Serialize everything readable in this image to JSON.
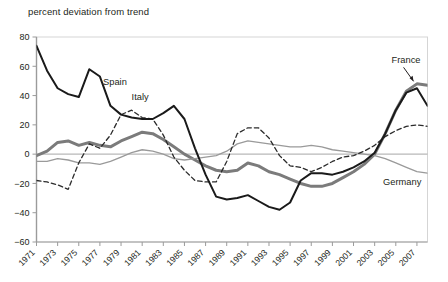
{
  "axis_title": "percent deviation from trend",
  "chart_data": {
    "type": "line",
    "title": "",
    "subtitle": "",
    "xlabel": "",
    "ylabel": "percent deviation from trend",
    "ylim": [
      -60,
      80
    ],
    "xlim": [
      1971,
      2008
    ],
    "grid": false,
    "legend_position": "inline-annotations",
    "yticks": [
      80,
      60,
      40,
      20,
      0,
      -20,
      -40,
      -60
    ],
    "ytick_labels": [
      "80",
      "60",
      "40",
      "20",
      "0",
      "−20",
      "−40",
      "−60"
    ],
    "xticks": [
      1971,
      1973,
      1975,
      1977,
      1979,
      1981,
      1983,
      1985,
      1987,
      1989,
      1991,
      1993,
      1995,
      1997,
      1999,
      2001,
      2003,
      2005,
      2007
    ],
    "xtick_labels": [
      "1971",
      "1973",
      "1975",
      "1977",
      "1979",
      "1981",
      "1983",
      "1985",
      "1987",
      "1989",
      "1991",
      "1993",
      "1995",
      "1997",
      "1999",
      "2001",
      "2003",
      "2005",
      "2007"
    ],
    "zero_line": 0,
    "x": [
      1971,
      1972,
      1973,
      1974,
      1975,
      1976,
      1977,
      1978,
      1979,
      1980,
      1981,
      1982,
      1983,
      1984,
      1985,
      1986,
      1987,
      1988,
      1989,
      1990,
      1991,
      1992,
      1993,
      1994,
      1995,
      1996,
      1997,
      1998,
      1999,
      2000,
      2001,
      2002,
      2003,
      2004,
      2005,
      2006,
      2007,
      2008
    ],
    "series": [
      {
        "name": "Spain",
        "style": "solid-black",
        "color": "#1a1a1a",
        "width": 2.0,
        "values": [
          74,
          57,
          45,
          41,
          39,
          58,
          53,
          33,
          27,
          25,
          24,
          24,
          28,
          33,
          24,
          4,
          -14,
          -29,
          -31,
          -30,
          -28,
          -32,
          -36,
          -38,
          -33,
          -18,
          -13,
          -13,
          -14,
          -12,
          -9,
          -5,
          1,
          14,
          30,
          42,
          45,
          33
        ]
      },
      {
        "name": "Italy",
        "style": "dashed-black",
        "color": "#2b2b2b",
        "width": 1.3,
        "values": [
          -18,
          -19,
          -21,
          -24,
          -6,
          7,
          4,
          13,
          27,
          30,
          25,
          24,
          13,
          -2,
          -11,
          -18,
          -19,
          -19,
          -5,
          14,
          18,
          18,
          11,
          -1,
          -8,
          -9,
          -12,
          -9,
          -5,
          -2,
          -1,
          2,
          6,
          12,
          16,
          19,
          20,
          19
        ]
      },
      {
        "name": "France",
        "style": "solid-gray-thick",
        "color": "#7b7b7b",
        "width": 3.0,
        "values": [
          -1,
          2,
          8,
          9,
          6,
          8,
          6,
          5,
          9,
          12,
          15,
          14,
          10,
          5,
          0,
          -4,
          -8,
          -11,
          -12,
          -11,
          -6,
          -8,
          -12,
          -14,
          -17,
          -20,
          -22,
          -22,
          -20,
          -16,
          -12,
          -7,
          0,
          14,
          30,
          43,
          48,
          47
        ]
      },
      {
        "name": "Germany",
        "style": "solid-gray-thin",
        "color": "#9a9a9a",
        "width": 1.3,
        "values": [
          -5,
          -5,
          -3,
          -4,
          -6,
          -6,
          -7,
          -5,
          -2,
          1,
          3,
          2,
          0,
          -3,
          -4,
          -3,
          -2,
          -1,
          2,
          7,
          9,
          8,
          7,
          6,
          5,
          5,
          6,
          5,
          3,
          2,
          1,
          0,
          -1,
          -3,
          -6,
          -9,
          -12,
          -13
        ]
      }
    ],
    "annotations": [
      {
        "text": "Spain",
        "x": 1977.3,
        "y": 47,
        "arrow": false
      },
      {
        "text": "Italy",
        "x": 1980.0,
        "y": 37,
        "arrow": false
      },
      {
        "text": "France",
        "x": 2004.6,
        "y": 62,
        "arrow": true
      },
      {
        "text": "Germany",
        "x": 2003.8,
        "y": -21,
        "arrow": false
      }
    ]
  }
}
